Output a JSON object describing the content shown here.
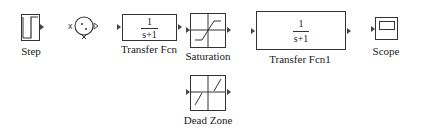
{
  "diagram": {
    "blocks": [
      {
        "id": "step",
        "label": "Step",
        "type": "step-source"
      },
      {
        "id": "sum",
        "label": "",
        "type": "circle-sum"
      },
      {
        "id": "transfer_fcn",
        "label": "Transfer Fcn",
        "type": "transfer-function",
        "numerator": "1",
        "denominator": "s+1"
      },
      {
        "id": "saturation",
        "label": "Saturation",
        "type": "saturation"
      },
      {
        "id": "transfer_fcn1",
        "label": "Transfer Fcn1",
        "type": "transfer-function",
        "numerator": "1",
        "denominator": "s+1"
      },
      {
        "id": "scope",
        "label": "Scope",
        "type": "scope-sink"
      },
      {
        "id": "dead_zone",
        "label": "Dead Zone",
        "type": "dead-zone"
      }
    ]
  }
}
